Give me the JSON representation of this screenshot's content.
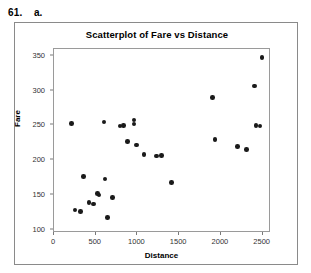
{
  "problem": {
    "number": "61.",
    "part": "a."
  },
  "chart_data": {
    "type": "scatter",
    "title": "Scatterplot of Fare vs Distance",
    "xlabel": "Distance",
    "ylabel": "Fare",
    "xlim": [
      0,
      2600
    ],
    "ylim": [
      95,
      360
    ],
    "xticks": [
      0,
      500,
      1000,
      1500,
      2000,
      2500
    ],
    "yticks": [
      100,
      150,
      200,
      250,
      300,
      350
    ],
    "xtick_labels": [
      "0",
      "500",
      "1000",
      "1500",
      "2000",
      "2500"
    ],
    "ytick_labels": [
      "100",
      "150",
      "200",
      "250",
      "300",
      "350"
    ],
    "grid": false,
    "legend": false,
    "marker_color": "#1a1a1a",
    "points": [
      {
        "x": 210,
        "y": 253
      },
      {
        "x": 250,
        "y": 128
      },
      {
        "x": 320,
        "y": 126
      },
      {
        "x": 350,
        "y": 176
      },
      {
        "x": 420,
        "y": 139
      },
      {
        "x": 470,
        "y": 137
      },
      {
        "x": 520,
        "y": 152
      },
      {
        "x": 540,
        "y": 150
      },
      {
        "x": 600,
        "y": 255
      },
      {
        "x": 610,
        "y": 173
      },
      {
        "x": 640,
        "y": 117
      },
      {
        "x": 700,
        "y": 146
      },
      {
        "x": 790,
        "y": 249
      },
      {
        "x": 830,
        "y": 250
      },
      {
        "x": 880,
        "y": 227
      },
      {
        "x": 960,
        "y": 258
      },
      {
        "x": 960,
        "y": 252
      },
      {
        "x": 990,
        "y": 222
      },
      {
        "x": 1080,
        "y": 208
      },
      {
        "x": 1230,
        "y": 206
      },
      {
        "x": 1290,
        "y": 207
      },
      {
        "x": 1410,
        "y": 168
      },
      {
        "x": 1900,
        "y": 290
      },
      {
        "x": 1930,
        "y": 230
      },
      {
        "x": 2200,
        "y": 220
      },
      {
        "x": 2310,
        "y": 215
      },
      {
        "x": 2400,
        "y": 307
      },
      {
        "x": 2420,
        "y": 250
      },
      {
        "x": 2470,
        "y": 249
      },
      {
        "x": 2490,
        "y": 348
      }
    ]
  }
}
